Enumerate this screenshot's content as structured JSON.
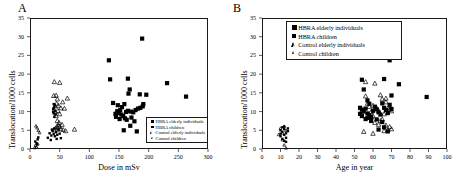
{
  "figure": {
    "panel_a_letter": "A",
    "panel_b_letter": "B"
  },
  "legend_entries": [
    {
      "label": "HBRA elderly individuals",
      "marker": "filled-square-large"
    },
    {
      "label": "HBRA children",
      "marker": "filled-square-small"
    },
    {
      "label": "Control elderly individuals",
      "marker": "open-triangle-large"
    },
    {
      "label": "Control children",
      "marker": "open-triangle-small"
    }
  ],
  "chart_data": [
    {
      "type": "scatter",
      "panel": "A",
      "title": "",
      "xlabel": "Dose in mSv",
      "ylabel": "Translocation/1000 cells",
      "xlim": [
        0,
        300
      ],
      "ylim": [
        0,
        35
      ],
      "xticks": [
        0,
        50,
        100,
        150,
        200,
        250,
        300
      ],
      "yticks": [
        0,
        5,
        10,
        15,
        20,
        25,
        30,
        35
      ],
      "grid": false,
      "legend_position": "lower-right-inside",
      "series": [
        {
          "name": "HBRA elderly individuals",
          "marker": "filled-square-large",
          "points": [
            [
              133,
              23.7
            ],
            [
              189,
              29.5
            ],
            [
              135,
              18.6
            ],
            [
              165,
              18.8
            ],
            [
              231,
              17.6
            ],
            [
              263,
              14.0
            ],
            [
              168,
              15.9
            ],
            [
              166,
              14.8
            ],
            [
              185,
              14.6
            ],
            [
              196,
              14.5
            ],
            [
              140,
              12.3
            ],
            [
              148,
              11.7
            ],
            [
              155,
              11.2
            ],
            [
              159,
              12.0
            ],
            [
              152,
              10.4
            ],
            [
              147,
              10.1
            ],
            [
              150,
              9.6
            ],
            [
              154,
              9.2
            ],
            [
              157,
              8.8
            ],
            [
              162,
              9.9
            ],
            [
              165,
              10.2
            ],
            [
              170,
              10.0
            ],
            [
              174,
              9.8
            ],
            [
              178,
              10.4
            ],
            [
              182,
              10.8
            ],
            [
              186,
              11.0
            ],
            [
              190,
              11.4
            ],
            [
              191,
              12.0
            ],
            [
              160,
              8.2
            ],
            [
              163,
              7.8
            ],
            [
              171,
              8.4
            ],
            [
              176,
              7.4
            ],
            [
              145,
              8.6
            ],
            [
              151,
              8.0
            ],
            [
              144,
              9.4
            ],
            [
              180,
              4.7
            ],
            [
              169,
              6.2
            ],
            [
              158,
              5.0
            ]
          ]
        },
        {
          "name": "HBRA children",
          "marker": "filled-square-small",
          "points": [
            [
              9,
              2.0
            ],
            [
              11,
              1.5
            ],
            [
              13,
              2.6
            ],
            [
              14,
              3.1
            ],
            [
              12,
              1.2
            ],
            [
              33,
              4.2
            ],
            [
              36,
              3.6
            ],
            [
              38,
              4.8
            ],
            [
              40,
              4.0
            ],
            [
              42,
              3.4
            ],
            [
              44,
              4.5
            ],
            [
              46,
              3.8
            ],
            [
              48,
              5.0
            ],
            [
              50,
              4.1
            ],
            [
              52,
              2.9
            ],
            [
              41,
              5.5
            ],
            [
              37,
              5.2
            ],
            [
              45,
              2.7
            ],
            [
              35,
              2.4
            ],
            [
              30,
              3.0
            ],
            [
              39,
              10.6
            ],
            [
              40,
              10.9
            ],
            [
              41,
              11.3
            ],
            [
              42,
              10.2
            ],
            [
              40,
              9.5
            ],
            [
              39,
              9.9
            ],
            [
              43,
              9.2
            ],
            [
              41,
              8.6
            ],
            [
              40,
              12.0
            ],
            [
              42,
              11.7
            ]
          ]
        },
        {
          "name": "Control elderly individuals",
          "marker": "open-triangle-large",
          "points": [
            [
              41,
              18.0
            ],
            [
              50,
              17.8
            ],
            [
              40,
              14.3
            ],
            [
              44,
              14.4
            ],
            [
              46,
              13.4
            ],
            [
              63,
              13.6
            ],
            [
              55,
              12.6
            ],
            [
              48,
              11.7
            ],
            [
              52,
              11.0
            ],
            [
              58,
              10.9
            ],
            [
              45,
              12.2
            ],
            [
              42,
              11.5
            ],
            [
              47,
              10.3
            ],
            [
              43,
              10.0
            ],
            [
              50,
              9.4
            ],
            [
              44,
              8.9
            ],
            [
              46,
              7.6
            ],
            [
              48,
              6.4
            ],
            [
              50,
              6.0
            ],
            [
              52,
              5.4
            ],
            [
              56,
              5.2
            ],
            [
              60,
              4.9
            ],
            [
              75,
              5.3
            ],
            [
              54,
              6.6
            ],
            [
              49,
              7.1
            ],
            [
              45,
              6.0
            ],
            [
              43,
              5.6
            ],
            [
              41,
              5.1
            ],
            [
              47,
              5.8
            ]
          ]
        },
        {
          "name": "Control children",
          "marker": "open-triangle-small",
          "points": [
            [
              9,
              1.0
            ],
            [
              11,
              0.6
            ],
            [
              13,
              1.4
            ],
            [
              8,
              0.4
            ],
            [
              12,
              5.7
            ],
            [
              10,
              6.2
            ],
            [
              14,
              5.0
            ],
            [
              16,
              4.4
            ]
          ]
        }
      ]
    },
    {
      "type": "scatter",
      "panel": "B",
      "title": "",
      "xlabel": "Age in year",
      "ylabel": "Translocation/1000 cells",
      "xlim": [
        0,
        100
      ],
      "ylim": [
        0,
        35
      ],
      "xticks": [
        0,
        10,
        20,
        30,
        40,
        50,
        60,
        70,
        80,
        90,
        100
      ],
      "yticks": [
        0,
        5,
        10,
        15,
        20,
        25,
        30,
        35
      ],
      "grid": false,
      "legend_position": "upper-left-inside",
      "series": [
        {
          "name": "HBRA elderly individuals",
          "marker": "filled-square-large",
          "points": [
            [
              69,
              29.5
            ],
            [
              69,
              23.7
            ],
            [
              54,
              18.5
            ],
            [
              66,
              18.7
            ],
            [
              74,
              17.3
            ],
            [
              89,
              13.9
            ],
            [
              55,
              15.9
            ],
            [
              70,
              14.3
            ],
            [
              57,
              13.0
            ],
            [
              58,
              12.1
            ],
            [
              53,
              11.0
            ],
            [
              54,
              10.5
            ],
            [
              55,
              10.0
            ],
            [
              56,
              10.8
            ],
            [
              57,
              9.5
            ],
            [
              58,
              9.0
            ],
            [
              59,
              8.5
            ],
            [
              60,
              10.2
            ],
            [
              61,
              11.3
            ],
            [
              62,
              10.6
            ],
            [
              63,
              9.8
            ],
            [
              64,
              9.2
            ],
            [
              65,
              12.2
            ],
            [
              66,
              11.0
            ],
            [
              67,
              10.4
            ],
            [
              68,
              9.6
            ],
            [
              69,
              11.8
            ],
            [
              70,
              10.7
            ],
            [
              56,
              8.0
            ],
            [
              59,
              7.5
            ],
            [
              62,
              7.9
            ],
            [
              65,
              7.2
            ],
            [
              54,
              8.8
            ],
            [
              57,
              8.3
            ],
            [
              53,
              9.4
            ],
            [
              68,
              4.7
            ],
            [
              66,
              5.8
            ],
            [
              63,
              5.2
            ]
          ]
        },
        {
          "name": "HBRA children",
          "marker": "filled-square-small",
          "points": [
            [
              10,
              3.4
            ],
            [
              11,
              4.6
            ],
            [
              12,
              5.3
            ],
            [
              12,
              2.2
            ],
            [
              13,
              3.0
            ],
            [
              13,
              4.2
            ],
            [
              11,
              5.8
            ],
            [
              12,
              6.0
            ],
            [
              14,
              4.8
            ],
            [
              10,
              5.0
            ],
            [
              13,
              1.9
            ],
            [
              12,
              3.8
            ],
            [
              11,
              2.7
            ],
            [
              14,
              5.5
            ],
            [
              10,
              4.1
            ]
          ]
        },
        {
          "name": "Control elderly individuals",
          "marker": "open-triangle-large",
          "points": [
            [
              56,
              18.0
            ],
            [
              61,
              17.6
            ],
            [
              56,
              14.2
            ],
            [
              64,
              14.5
            ],
            [
              65,
              13.4
            ],
            [
              67,
              13.6
            ],
            [
              67,
              12.6
            ],
            [
              60,
              11.7
            ],
            [
              62,
              11.0
            ],
            [
              68,
              10.9
            ],
            [
              57,
              12.2
            ],
            [
              58,
              11.4
            ],
            [
              63,
              10.3
            ],
            [
              59,
              10.0
            ],
            [
              66,
              9.4
            ],
            [
              60,
              8.9
            ],
            [
              64,
              7.6
            ],
            [
              67,
              6.4
            ],
            [
              69,
              6.0
            ],
            [
              70,
              5.4
            ],
            [
              68,
              5.2
            ],
            [
              66,
              4.9
            ],
            [
              60,
              4.2
            ],
            [
              55,
              4.7
            ],
            [
              63,
              6.6
            ],
            [
              61,
              7.1
            ],
            [
              69,
              10.6
            ],
            [
              70,
              10.2
            ],
            [
              65,
              8.0
            ],
            [
              59,
              8.6
            ]
          ]
        },
        {
          "name": "Control children",
          "marker": "open-triangle-small",
          "points": [
            [
              10,
              5.6
            ],
            [
              11,
              4.3
            ],
            [
              12,
              6.1
            ],
            [
              13,
              0.3
            ],
            [
              9,
              3.9
            ],
            [
              11,
              2.5
            ],
            [
              13,
              5.0
            ],
            [
              12,
              1.1
            ]
          ]
        }
      ]
    }
  ]
}
